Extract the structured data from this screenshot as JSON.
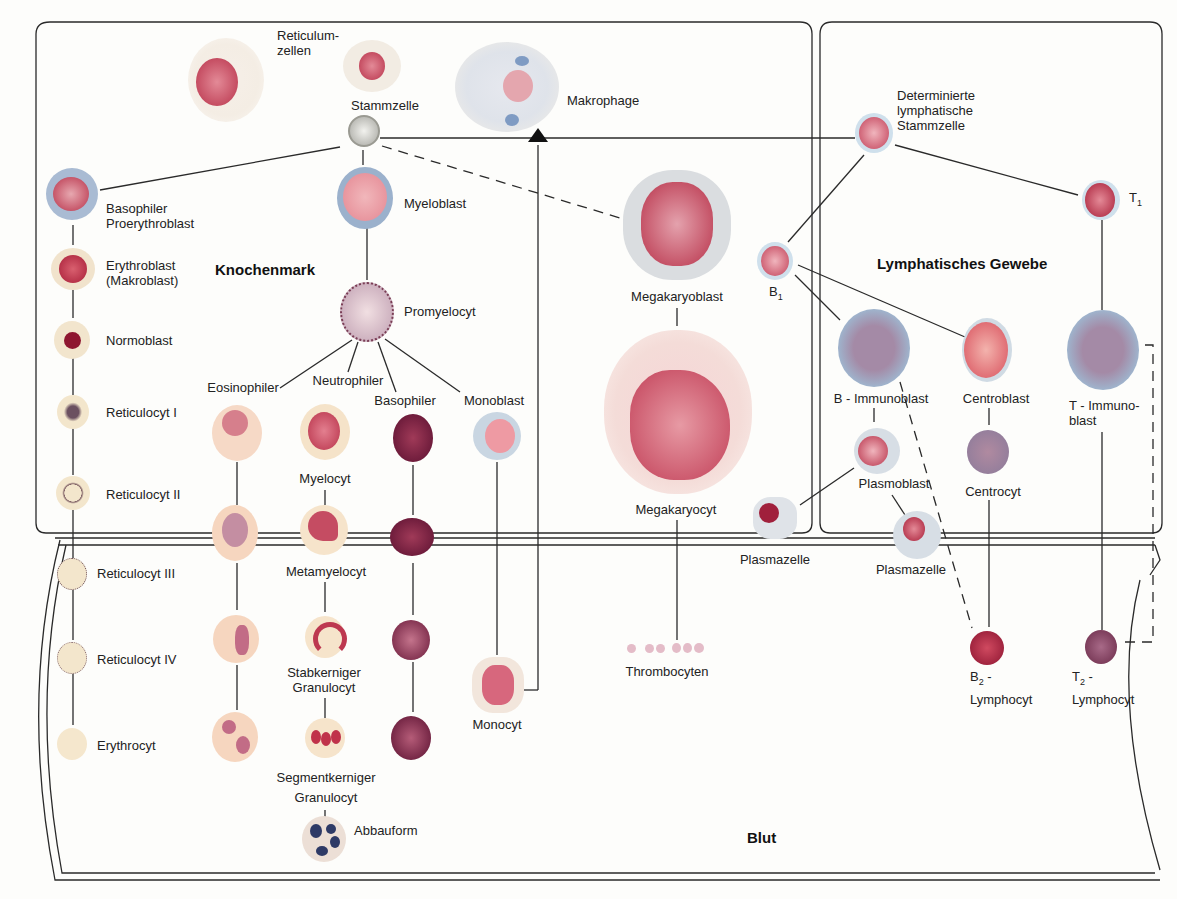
{
  "regions": {
    "bone_marrow": "Knochenmark",
    "lymphatic": "Lymphatisches Gewebe",
    "blood": "Blut"
  },
  "colors": {
    "line": "#2a2a2a",
    "nucleus_red": "#b8324a",
    "cytoplasm_blue": "#9fb3cc",
    "cytoplasm_beige": "#f3e3c8",
    "cytoplasm_grey": "#d9dde2"
  },
  "labels": {
    "reticulum": "Reticulum-\nzellen",
    "stammzelle": "Stammzelle",
    "makrophage": "Makrophage",
    "det_lymph": "Determinierte\nlymphatische\nStammzelle",
    "basophiler_proery": "Basophiler\nProerythroblast",
    "myeloblast": "Myeloblast",
    "erythroblast": "Erythroblast\n(Makroblast)",
    "normoblast": "Normoblast",
    "reti1": "Reticulocyt I",
    "reti2": "Reticulocyt II",
    "reti3": "Reticulocyt III",
    "reti4": "Reticulocyt IV",
    "erythrocyt": "Erythrocyt",
    "promyelocyt": "Promyelocyt",
    "eosinophiler": "Eosinophiler",
    "neutrophiler": "Neutrophiler",
    "basophiler": "Basophiler",
    "monoblast": "Monoblast",
    "myelocyt": "Myelocyt",
    "metamyelocyt": "Metamyelocyt",
    "stabkerniger": "Stabkerniger\nGranulocyt",
    "segmentkerniger": "Segmentkerniger\nGranulocyt",
    "abbauform": "Abbauform",
    "monocyt": "Monocyt",
    "megakaryoblast": "Megakaryoblast",
    "megakaryocyt": "Megakaryocyt",
    "thrombocyten": "Thrombocyten",
    "b1": "B",
    "b1_sub": "1",
    "t1": "T",
    "t1_sub": "1",
    "b_immunoblast": "B - Immunoblast",
    "centroblast": "Centroblast",
    "t_immunoblast": "T - Immuno-\nblast",
    "plasmoblast": "Plasmoblast",
    "centrocyt": "Centrocyt",
    "plasmazelle_1": "Plasmazelle",
    "plasmazelle_2": "Plasmazelle",
    "b2": "B",
    "b2_sub": "2",
    "b2_rest": " -\nLymphocyt",
    "t2": "T",
    "t2_sub": "2",
    "t2_rest": " -\nLymphocyt"
  }
}
